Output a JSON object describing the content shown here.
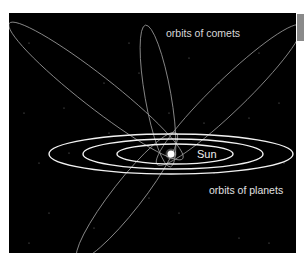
{
  "diagram": {
    "labels": {
      "comets": "orbits of comets",
      "sun": "Sun",
      "planets": "orbits of planets"
    },
    "colors": {
      "background": "#000000",
      "planet_orbit": "#f2f2f2",
      "comet_orbit": "#9a9a9a",
      "sun": "#ffffff",
      "text": "#e6e6e6",
      "side_tab": "#8a8a8a"
    },
    "sun": {
      "cx": 162,
      "cy": 141,
      "r": 3.5
    },
    "planet_orbits": [
      {
        "name": "outer",
        "cx": 162,
        "cy": 141,
        "rx": 122,
        "ry": 20
      },
      {
        "name": "middle",
        "cx": 164,
        "cy": 141,
        "rx": 90,
        "ry": 15
      },
      {
        "name": "inner",
        "cx": 166,
        "cy": 141,
        "rx": 58,
        "ry": 10
      }
    ],
    "comet_orbits": [
      {
        "name": "upper-left",
        "cx": 87,
        "cy": 78,
        "rx": 110,
        "ry": 16,
        "rotate": 38
      },
      {
        "name": "vertical",
        "cx": 149,
        "cy": 83,
        "rx": 72,
        "ry": 13,
        "rotate": 80
      },
      {
        "name": "upper-right",
        "cx": 220,
        "cy": 82,
        "rx": 100,
        "ry": 16,
        "rotate": -44
      },
      {
        "name": "lower-left",
        "cx": 118,
        "cy": 183,
        "rx": 80,
        "ry": 15,
        "rotate": -52
      }
    ],
    "stars": [
      [
        20,
        30
      ],
      [
        55,
        95
      ],
      [
        95,
        70
      ],
      [
        130,
        60
      ],
      [
        180,
        45
      ],
      [
        210,
        70
      ],
      [
        240,
        105
      ],
      [
        270,
        90
      ],
      [
        275,
        150
      ],
      [
        30,
        150
      ],
      [
        40,
        200
      ],
      [
        60,
        140
      ],
      [
        100,
        120
      ],
      [
        140,
        185
      ],
      [
        170,
        200
      ],
      [
        230,
        225
      ],
      [
        260,
        230
      ],
      [
        20,
        230
      ],
      [
        85,
        215
      ],
      [
        195,
        110
      ],
      [
        250,
        40
      ],
      [
        120,
        30
      ],
      [
        160,
        100
      ],
      [
        205,
        160
      ],
      [
        15,
        100
      ]
    ]
  }
}
